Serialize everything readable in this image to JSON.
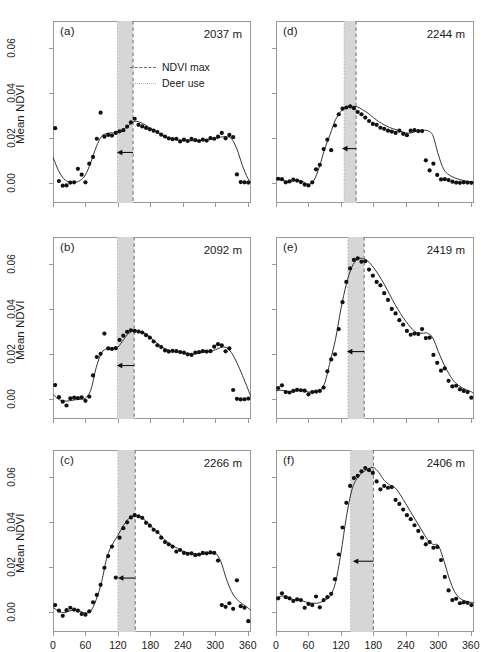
{
  "figure": {
    "axis": {
      "ylabel": "Mean NDVI",
      "xlabel": "Julian days",
      "yticks": [
        "0.00",
        "0.02",
        "0.04",
        "0.06"
      ],
      "ytick_values": [
        0.0,
        0.02,
        0.04,
        0.06
      ],
      "xticks": [
        "0",
        "60",
        "120",
        "180",
        "240",
        "300",
        "360"
      ],
      "xtick_values": [
        0,
        60,
        120,
        180,
        240,
        300,
        360
      ],
      "ylim": [
        -0.009,
        0.072
      ],
      "xlim": [
        0,
        366
      ]
    },
    "legend": {
      "ndvi_max": "NDVI max",
      "deer_use": "Deer use"
    },
    "colors": {
      "point": "#111111",
      "curve": "#333333",
      "band_fill": "#d6d6d6",
      "ndvi_max_line": "#6b6b6b",
      "deer_use_line": "#b4b4b4",
      "frame": "#9a9a9a",
      "arrow": "#111111"
    },
    "panel_labels": [
      "(a)",
      "(b)",
      "(c)",
      "(d)",
      "(e)",
      "(f)"
    ],
    "elevations": [
      "2037 m",
      "2092 m",
      "2266 m",
      "2244 m",
      "2419 m",
      "2406 m"
    ],
    "caption": ""
  },
  "chart_data": [
    {
      "id": "a",
      "type": "scatter",
      "panel": "(a)",
      "title": "2037 m",
      "elevation_m": 2037,
      "xlabel": "Julian days",
      "ylabel": "Mean NDVI",
      "xlim": [
        0,
        366
      ],
      "ylim": [
        -0.009,
        0.072
      ],
      "grid": false,
      "legend_position": "top-right",
      "ndvi_max_day": 148,
      "deer_use_start_day": 119,
      "arrow": {
        "from_day": 148,
        "to_day": 118,
        "y": 0.0135
      },
      "x": [
        4,
        11,
        18,
        25,
        32,
        39,
        46,
        53,
        60,
        67,
        74,
        81,
        88,
        95,
        102,
        109,
        116,
        123,
        130,
        137,
        144,
        151,
        158,
        165,
        172,
        179,
        186,
        193,
        200,
        207,
        214,
        221,
        228,
        235,
        242,
        249,
        256,
        263,
        270,
        277,
        284,
        291,
        298,
        305,
        312,
        319,
        326,
        333,
        340,
        347,
        354,
        361
      ],
      "y": [
        0.0243,
        0.0008,
        -0.0013,
        -0.0012,
        0.0001,
        0.0002,
        0.0062,
        0.0036,
        0.0002,
        0.0085,
        0.0115,
        0.0196,
        0.0312,
        0.0205,
        0.0213,
        0.021,
        0.0222,
        0.0229,
        0.0234,
        0.025,
        0.0269,
        0.0285,
        0.0258,
        0.0251,
        0.0244,
        0.0238,
        0.0232,
        0.0226,
        0.0214,
        0.0206,
        0.0198,
        0.0194,
        0.0196,
        0.0184,
        0.0192,
        0.0186,
        0.0195,
        0.019,
        0.0186,
        0.0192,
        0.0188,
        0.0199,
        0.0196,
        0.0205,
        0.0222,
        0.0198,
        0.0213,
        0.0203,
        0.0037,
        0.0003,
        0.0002,
        0.0001
      ],
      "curve_x": [
        0,
        10,
        20,
        30,
        40,
        50,
        60,
        70,
        80,
        90,
        100,
        110,
        120,
        130,
        140,
        150,
        160,
        170,
        180,
        190,
        200,
        210,
        220,
        230,
        240,
        250,
        260,
        270,
        280,
        290,
        300,
        310,
        320,
        330,
        340,
        350,
        360,
        366
      ],
      "curve_y": [
        0.0115,
        0.0055,
        0.0018,
        0.0003,
        0.0002,
        0.001,
        0.0035,
        0.0092,
        0.016,
        0.0207,
        0.022,
        0.0222,
        0.0224,
        0.0235,
        0.0256,
        0.0272,
        0.027,
        0.0258,
        0.0243,
        0.0229,
        0.0215,
        0.0203,
        0.0195,
        0.019,
        0.0188,
        0.0187,
        0.0187,
        0.0188,
        0.0189,
        0.0192,
        0.0197,
        0.0203,
        0.0205,
        0.0196,
        0.015,
        0.0078,
        0.002,
        0.0002
      ]
    },
    {
      "id": "b",
      "type": "scatter",
      "panel": "(b)",
      "title": "2092 m",
      "elevation_m": 2092,
      "xlabel": "Julian days",
      "ylabel": "Mean NDVI",
      "xlim": [
        0,
        366
      ],
      "ylim": [
        -0.009,
        0.072
      ],
      "grid": false,
      "ndvi_max_day": 150,
      "deer_use_start_day": 119,
      "arrow": {
        "from_day": 150,
        "to_day": 118,
        "y": 0.0148
      },
      "x": [
        4,
        11,
        18,
        25,
        32,
        39,
        46,
        53,
        60,
        67,
        74,
        81,
        88,
        95,
        102,
        109,
        116,
        123,
        130,
        137,
        144,
        151,
        158,
        165,
        172,
        179,
        186,
        193,
        200,
        207,
        214,
        221,
        228,
        235,
        242,
        249,
        256,
        263,
        270,
        277,
        284,
        291,
        298,
        305,
        312,
        319,
        326,
        333,
        340,
        347,
        354,
        361
      ],
      "y": [
        0.0061,
        0.0007,
        -0.0013,
        -0.003,
        0.0002,
        0.0005,
        0.0003,
        0.0006,
        -0.0009,
        0.001,
        0.0104,
        0.0186,
        0.02,
        0.029,
        0.0224,
        0.0222,
        0.0225,
        0.0262,
        0.0281,
        0.0298,
        0.0305,
        0.0302,
        0.0299,
        0.0295,
        0.0283,
        0.0272,
        0.0255,
        0.0238,
        0.023,
        0.0215,
        0.021,
        0.0213,
        0.0212,
        0.0208,
        0.0205,
        0.0198,
        0.0195,
        0.0206,
        0.0208,
        0.0212,
        0.021,
        0.0212,
        0.0232,
        0.0243,
        0.0238,
        0.0211,
        0.0224,
        0.0039,
        0.0,
        -0.0003,
        -0.0002,
        0.0001
      ],
      "curve_x": [
        0,
        10,
        20,
        30,
        40,
        50,
        60,
        70,
        80,
        90,
        100,
        110,
        120,
        130,
        140,
        150,
        160,
        170,
        180,
        190,
        200,
        210,
        220,
        230,
        240,
        250,
        260,
        270,
        280,
        290,
        300,
        310,
        320,
        330,
        340,
        350,
        360,
        366
      ],
      "curve_y": [
        0.002,
        -0.0002,
        -0.001,
        -0.0009,
        -0.0005,
        -0.0002,
        0.0003,
        0.004,
        0.014,
        0.0205,
        0.0223,
        0.0224,
        0.023,
        0.0262,
        0.0291,
        0.0302,
        0.03,
        0.0291,
        0.0273,
        0.0252,
        0.0233,
        0.022,
        0.0213,
        0.021,
        0.0205,
        0.02,
        0.0198,
        0.0203,
        0.0208,
        0.0212,
        0.0218,
        0.0228,
        0.0228,
        0.0205,
        0.016,
        0.0105,
        0.0045,
        0.0008
      ]
    },
    {
      "id": "c",
      "type": "scatter",
      "panel": "(c)",
      "title": "2266 m",
      "elevation_m": 2266,
      "xlabel": "Julian days",
      "ylabel": "Mean NDVI",
      "xlim": [
        0,
        366
      ],
      "ylim": [
        -0.009,
        0.072
      ],
      "grid": false,
      "ndvi_max_day": 152,
      "deer_use_start_day": 120,
      "arrow": {
        "from_day": 152,
        "to_day": 120,
        "y": 0.015
      },
      "x": [
        4,
        11,
        18,
        25,
        32,
        39,
        46,
        53,
        60,
        67,
        74,
        81,
        88,
        95,
        102,
        109,
        116,
        123,
        130,
        137,
        144,
        151,
        158,
        165,
        172,
        179,
        186,
        193,
        200,
        207,
        214,
        221,
        228,
        235,
        242,
        249,
        256,
        263,
        270,
        277,
        284,
        291,
        298,
        305,
        312,
        319,
        326,
        333,
        340,
        347,
        354,
        361
      ],
      "y": [
        0.003,
        0.0005,
        -0.0018,
        0.0007,
        0.0018,
        0.001,
        0.0005,
        -0.001,
        -0.0013,
        0.0002,
        0.0042,
        0.0075,
        0.012,
        0.0196,
        0.0248,
        0.029,
        0.0152,
        0.033,
        0.0372,
        0.0398,
        0.042,
        0.043,
        0.0425,
        0.0418,
        0.0396,
        0.0383,
        0.0365,
        0.0355,
        0.033,
        0.031,
        0.03,
        0.029,
        0.0268,
        0.0275,
        0.0262,
        0.0258,
        0.026,
        0.0252,
        0.0255,
        0.0262,
        0.026,
        0.0264,
        0.0262,
        0.0228,
        0.003,
        0.0022,
        0.0038,
        0.0013,
        0.014,
        0.0025,
        0.0018,
        -0.0042
      ],
      "curve_x": [
        0,
        10,
        20,
        30,
        40,
        50,
        60,
        70,
        80,
        90,
        100,
        110,
        120,
        130,
        140,
        150,
        160,
        170,
        180,
        190,
        200,
        210,
        220,
        230,
        240,
        250,
        260,
        270,
        280,
        290,
        300,
        310,
        320,
        330,
        340,
        350,
        360,
        366
      ],
      "curve_y": [
        0.002,
        0.0003,
        -0.0004,
        0.0003,
        0.0007,
        0.0003,
        -0.0005,
        0.0004,
        0.0055,
        0.0135,
        0.0245,
        0.03,
        0.034,
        0.0383,
        0.0415,
        0.0428,
        0.0424,
        0.0408,
        0.0382,
        0.0362,
        0.0338,
        0.0313,
        0.0295,
        0.0283,
        0.027,
        0.0262,
        0.0258,
        0.0256,
        0.0258,
        0.0261,
        0.0262,
        0.0225,
        0.015,
        0.009,
        0.0055,
        0.0035,
        0.0018,
        0.0005
      ]
    },
    {
      "id": "d",
      "type": "scatter",
      "panel": "(d)",
      "title": "2244 m",
      "elevation_m": 2244,
      "xlabel": "Julian days",
      "ylabel": "Mean NDVI",
      "xlim": [
        0,
        366
      ],
      "ylim": [
        -0.009,
        0.072
      ],
      "grid": false,
      "ndvi_max_day": 148,
      "deer_use_start_day": 126,
      "arrow": {
        "from_day": 148,
        "to_day": 122,
        "y": 0.0152
      },
      "x": [
        4,
        11,
        18,
        25,
        32,
        39,
        46,
        53,
        60,
        67,
        74,
        81,
        88,
        95,
        102,
        109,
        116,
        123,
        130,
        137,
        144,
        151,
        158,
        165,
        172,
        179,
        186,
        193,
        200,
        207,
        214,
        221,
        228,
        235,
        242,
        249,
        256,
        263,
        270,
        277,
        284,
        291,
        298,
        305,
        312,
        319,
        326,
        333,
        340,
        347,
        354,
        361
      ],
      "y": [
        0.0018,
        0.0016,
        0.0002,
        0.0006,
        0.0014,
        0.001,
        0.0003,
        -0.0008,
        -0.0012,
        0.0002,
        0.006,
        0.008,
        0.015,
        0.0192,
        0.0145,
        0.0255,
        0.0305,
        0.033,
        0.0335,
        0.034,
        0.0332,
        0.0315,
        0.0305,
        0.029,
        0.0275,
        0.0262,
        0.0258,
        0.0245,
        0.024,
        0.0232,
        0.0228,
        0.0222,
        0.0232,
        0.0218,
        0.0212,
        0.0232,
        0.0234,
        0.023,
        0.023,
        0.01,
        0.0055,
        0.0085,
        0.0035,
        0.0015,
        0.0016,
        0.0012,
        0.0005,
        0.0001,
        0.0,
        0.0002,
        0.0001,
        0.0
      ],
      "curve_x": [
        0,
        10,
        20,
        30,
        40,
        50,
        60,
        70,
        80,
        90,
        100,
        110,
        120,
        130,
        140,
        150,
        160,
        170,
        180,
        190,
        200,
        210,
        220,
        230,
        240,
        250,
        260,
        270,
        280,
        290,
        300,
        310,
        320,
        330,
        340,
        350,
        360,
        366
      ],
      "curve_y": [
        0.0017,
        0.0012,
        0.0006,
        0.0008,
        0.001,
        0.0005,
        -0.0008,
        0.001,
        0.007,
        0.015,
        0.0215,
        0.028,
        0.0318,
        0.0335,
        0.034,
        0.0338,
        0.0325,
        0.031,
        0.029,
        0.0272,
        0.0258,
        0.0246,
        0.0238,
        0.023,
        0.0222,
        0.0222,
        0.023,
        0.0233,
        0.0232,
        0.021,
        0.0125,
        0.006,
        0.0035,
        0.0022,
        0.0014,
        0.0008,
        0.0004,
        0.0002
      ]
    },
    {
      "id": "e",
      "type": "scatter",
      "panel": "(e)",
      "title": "2419 m",
      "elevation_m": 2419,
      "xlabel": "Julian days",
      "ylabel": "Mean NDVI",
      "xlim": [
        0,
        366
      ],
      "ylim": [
        -0.009,
        0.072
      ],
      "grid": false,
      "ndvi_max_day": 163,
      "deer_use_start_day": 133,
      "arrow": {
        "from_day": 163,
        "to_day": 131,
        "y": 0.021
      },
      "x": [
        4,
        11,
        18,
        25,
        32,
        39,
        46,
        53,
        60,
        67,
        74,
        81,
        88,
        95,
        102,
        109,
        116,
        123,
        130,
        137,
        144,
        151,
        158,
        165,
        172,
        179,
        186,
        193,
        200,
        207,
        214,
        221,
        228,
        235,
        242,
        249,
        256,
        263,
        270,
        277,
        284,
        291,
        298,
        305,
        312,
        319,
        326,
        333,
        340,
        347,
        354,
        361
      ],
      "y": [
        0.0048,
        0.006,
        0.003,
        0.0028,
        0.0035,
        0.004,
        0.0038,
        0.0036,
        0.002,
        0.003,
        0.0032,
        0.0035,
        0.005,
        0.0122,
        0.0175,
        0.0198,
        0.031,
        0.043,
        0.052,
        0.058,
        0.0618,
        0.0625,
        0.061,
        0.0612,
        0.0575,
        0.0548,
        0.052,
        0.0505,
        0.047,
        0.044,
        0.04,
        0.038,
        0.035,
        0.033,
        0.0302,
        0.0285,
        0.029,
        0.0288,
        0.031,
        0.027,
        0.0272,
        0.0195,
        0.016,
        0.0125,
        0.0135,
        0.008,
        0.0055,
        0.0058,
        0.0042,
        0.0035,
        0.003,
        0.0005
      ],
      "curve_x": [
        0,
        10,
        20,
        30,
        40,
        50,
        60,
        70,
        80,
        90,
        100,
        110,
        120,
        130,
        140,
        150,
        160,
        170,
        180,
        190,
        200,
        210,
        220,
        230,
        240,
        250,
        260,
        270,
        280,
        290,
        300,
        310,
        320,
        330,
        340,
        350,
        360,
        366
      ],
      "curve_y": [
        0.0035,
        0.0038,
        0.0033,
        0.0032,
        0.0036,
        0.0037,
        0.003,
        0.003,
        0.0035,
        0.007,
        0.0165,
        0.0265,
        0.04,
        0.051,
        0.0585,
        0.062,
        0.0625,
        0.0612,
        0.0585,
        0.055,
        0.051,
        0.0465,
        0.042,
        0.038,
        0.0345,
        0.0315,
        0.0295,
        0.0292,
        0.0292,
        0.027,
        0.021,
        0.0155,
        0.011,
        0.0075,
        0.0055,
        0.0042,
        0.0032,
        0.0025
      ]
    },
    {
      "id": "f",
      "type": "scatter",
      "panel": "(f)",
      "title": "2406 m",
      "elevation_m": 2406,
      "xlabel": "Julian days",
      "ylabel": "Mean NDVI",
      "xlim": [
        0,
        366
      ],
      "ylim": [
        -0.009,
        0.072
      ],
      "grid": false,
      "ndvi_max_day": 180,
      "deer_use_start_day": 138,
      "arrow": {
        "from_day": 180,
        "to_day": 142,
        "y": 0.0225
      },
      "x": [
        4,
        11,
        18,
        25,
        32,
        39,
        46,
        53,
        60,
        67,
        74,
        81,
        88,
        95,
        102,
        109,
        116,
        123,
        130,
        137,
        144,
        151,
        158,
        165,
        172,
        179,
        186,
        193,
        200,
        207,
        214,
        221,
        228,
        235,
        242,
        249,
        256,
        263,
        270,
        277,
        284,
        291,
        298,
        305,
        312,
        319,
        326,
        333,
        340,
        347,
        354,
        361
      ],
      "y": [
        0.006,
        0.0082,
        0.0065,
        0.006,
        0.0048,
        0.0055,
        0.0052,
        0.0018,
        0.0035,
        0.003,
        0.0068,
        0.002,
        0.0052,
        0.0065,
        0.008,
        0.0145,
        0.0255,
        0.0375,
        0.0485,
        0.056,
        0.0595,
        0.0605,
        0.0625,
        0.064,
        0.063,
        0.0618,
        0.058,
        0.0545,
        0.056,
        0.0552,
        0.0555,
        0.0498,
        0.048,
        0.0455,
        0.043,
        0.0412,
        0.0385,
        0.036,
        0.033,
        0.03,
        0.031,
        0.0285,
        0.0288,
        0.023,
        0.0155,
        0.0095,
        0.0052,
        0.0058,
        0.0038,
        0.0042,
        0.004,
        0.003
      ],
      "curve_x": [
        0,
        10,
        20,
        30,
        40,
        50,
        60,
        70,
        80,
        90,
        100,
        110,
        120,
        130,
        140,
        150,
        160,
        170,
        180,
        190,
        200,
        210,
        220,
        230,
        240,
        250,
        260,
        270,
        280,
        290,
        300,
        310,
        320,
        330,
        340,
        350,
        360,
        366
      ],
      "curve_y": [
        0.006,
        0.007,
        0.0066,
        0.0055,
        0.0052,
        0.0048,
        0.004,
        0.0038,
        0.004,
        0.0052,
        0.007,
        0.013,
        0.026,
        0.042,
        0.054,
        0.0595,
        0.062,
        0.0635,
        0.0642,
        0.062,
        0.0585,
        0.0565,
        0.0552,
        0.052,
        0.048,
        0.044,
        0.04,
        0.036,
        0.0322,
        0.03,
        0.0295,
        0.023,
        0.015,
        0.009,
        0.006,
        0.0048,
        0.0042,
        0.004
      ]
    }
  ]
}
